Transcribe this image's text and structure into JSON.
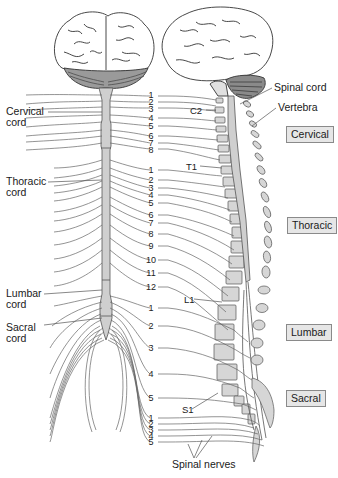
{
  "diagram": {
    "type": "anatomical-spinal-cord-and-nerves",
    "colors": {
      "cord_fill": "#cfcfcf",
      "vertebra_fill": "#d6d6d6",
      "line": "#555555",
      "region_box_fill": "#e6e6e6",
      "background": "#ffffff"
    },
    "left_labels": {
      "cervical": [
        "Cervical",
        "cord"
      ],
      "thoracic": [
        "Thoracic",
        "cord"
      ],
      "lumbar": [
        "Lumbar",
        "cord"
      ],
      "sacral": [
        "Sacral",
        "cord"
      ]
    },
    "right_labels": {
      "spinal_cord": "Spinal cord",
      "vertebra": "Vertebra",
      "c2": "C2",
      "t1": "T1",
      "l1": "L1",
      "s1": "S1",
      "spinal_nerves": "Spinal nerves"
    },
    "region_boxes": {
      "cervical": "Cervical",
      "thoracic": "Thoracic",
      "lumbar": "Lumbar",
      "sacral": "Sacral"
    },
    "nerve_numbers": {
      "cervical": [
        "1",
        "2",
        "3",
        "4",
        "5",
        "6",
        "7",
        "8"
      ],
      "thoracic": [
        "1",
        "2",
        "3",
        "4",
        "5",
        "6",
        "7",
        "8",
        "9",
        "10",
        "11",
        "12"
      ],
      "lumbar": [
        "1",
        "2",
        "3",
        "4",
        "5"
      ],
      "sacral": [
        "1",
        "2",
        "3",
        "4",
        "5"
      ]
    }
  }
}
